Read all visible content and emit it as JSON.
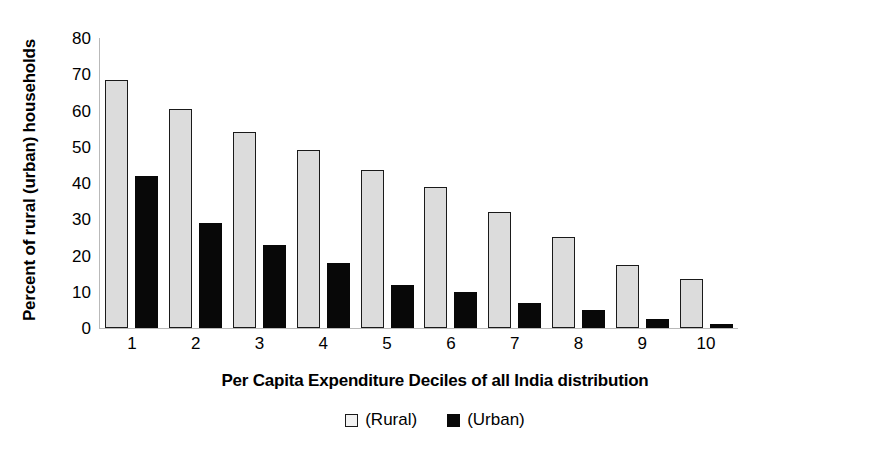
{
  "chart_data": {
    "type": "bar",
    "title": "",
    "subtitle": "",
    "xlabel": "Per Capita Expenditure Deciles of all India distribution",
    "ylabel": "Percent of rural (urban) households",
    "categories": [
      "1",
      "2",
      "3",
      "4",
      "5",
      "6",
      "7",
      "8",
      "9",
      "10"
    ],
    "series": [
      {
        "name": "(Rural)",
        "values": [
          68.5,
          60.5,
          54,
          49,
          43.5,
          39,
          32,
          25,
          17.5,
          13.5
        ],
        "color": "#dcdcdc",
        "border_color": "#1a1a1a"
      },
      {
        "name": "(Urban)",
        "values": [
          42,
          29,
          23,
          18,
          12,
          10,
          7,
          5,
          2.5,
          1
        ],
        "color": "#080808",
        "border_color": "#080808"
      }
    ],
    "ylim": [
      0,
      80
    ],
    "yticks": [
      80,
      70,
      60,
      50,
      40,
      30,
      20,
      10,
      0
    ],
    "ytick_labels": [
      "80",
      "70",
      "60",
      "50",
      "40",
      "30",
      "20",
      "10",
      "0"
    ],
    "grid": false,
    "legend_position": "bottom",
    "axis_color": "#b9b9b9"
  },
  "axes": {
    "y_title": "Percent of rural (urban) households",
    "x_title": "Per Capita Expenditure Deciles of all India distribution"
  },
  "legend": {
    "items": [
      {
        "label": "(Rural)",
        "marker": "open-square-marker"
      },
      {
        "label": "(Urban)",
        "marker": "filled-square-marker"
      }
    ]
  }
}
